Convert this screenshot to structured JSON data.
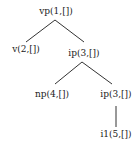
{
  "tree": {
    "nodes": [
      {
        "id": "n1",
        "label": "vp(1,[])"
      },
      {
        "id": "n2",
        "label": "v(2,[])"
      },
      {
        "id": "n3",
        "label": "ip(3,[])"
      },
      {
        "id": "n4",
        "label": "np(4,[])"
      },
      {
        "id": "n5",
        "label": "ip(3,[])"
      },
      {
        "id": "n6",
        "label": "i1(5,[])"
      }
    ],
    "edges": [
      {
        "from": "vp(1,[])",
        "to": "v(2,[])"
      },
      {
        "from": "vp(1,[])",
        "to": "ip(3,[])"
      },
      {
        "from": "ip(3,[])",
        "to": "np(4,[])"
      },
      {
        "from": "ip(3,[])",
        "to": "ip(3,[])"
      },
      {
        "from": "ip(3,[])",
        "to": "i1(5,[])"
      }
    ]
  }
}
